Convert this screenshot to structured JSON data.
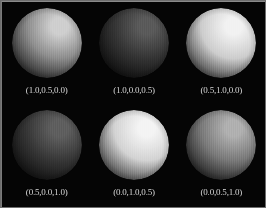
{
  "figure": {
    "background_color": "#050505",
    "caption_color": "#d8d8d8",
    "border_color": "#6e6e6e",
    "columns": 3,
    "rows": 2
  },
  "chart_data": {
    "type": "table",
    "title": "",
    "xlabel": "",
    "ylabel": "",
    "categories": [
      "(1.0,0.5,0.0)",
      "(1.0,0.0,0.5)",
      "(0.5,1.0,0.0)",
      "(0.5,0.0,1.0)",
      "(0.0,1.0,0.5)",
      "(0.0,0.5,1.0)"
    ],
    "values": [
      72,
      26,
      196,
      30,
      205,
      96
    ],
    "series": [
      {
        "name": "sphere_brightness",
        "values": [
          72,
          26,
          196,
          30,
          205,
          96
        ]
      }
    ]
  },
  "panels": [
    {
      "id": "panel-1",
      "label": "(1.0,0.5,0.0)",
      "params": [
        1.0,
        0.5,
        0.0
      ],
      "highlight": "#cfcfcf",
      "mid": "#8d8d8d",
      "dark": "#141414",
      "brightness": 72
    },
    {
      "id": "panel-2",
      "label": "(1.0,0.0,0.5)",
      "params": [
        1.0,
        0.0,
        0.5
      ],
      "highlight": "#5a5a5a",
      "mid": "#343434",
      "dark": "#070707",
      "brightness": 26
    },
    {
      "id": "panel-3",
      "label": "(0.5,1.0,0.0)",
      "params": [
        0.5,
        1.0,
        0.0
      ],
      "highlight": "#f2f2f2",
      "mid": "#cdcdcd",
      "dark": "#2a2a2a",
      "brightness": 196
    },
    {
      "id": "panel-4",
      "label": "(0.5,0.0,1.0)",
      "params": [
        0.5,
        0.0,
        1.0
      ],
      "highlight": "#5f5f5f",
      "mid": "#373737",
      "dark": "#080808",
      "brightness": 30
    },
    {
      "id": "panel-5",
      "label": "(0.0,1.0,0.5)",
      "params": [
        0.0,
        1.0,
        0.5
      ],
      "highlight": "#f4f4f4",
      "mid": "#d3d3d3",
      "dark": "#2e2e2e",
      "brightness": 205
    },
    {
      "id": "panel-6",
      "label": "(0.0,0.5,1.0)",
      "params": [
        0.0,
        0.5,
        1.0
      ],
      "highlight": "#b0b0b0",
      "mid": "#7a7a7a",
      "dark": "#101010",
      "brightness": 96
    }
  ]
}
